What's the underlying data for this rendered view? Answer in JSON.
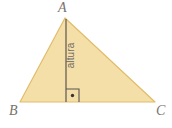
{
  "figure": {
    "type": "geometry-diagram",
    "background_color": "#ffffff",
    "triangle": {
      "fill_color": "#f5dfa8",
      "stroke_color": "#e0bd6a",
      "stroke_width": 1.2,
      "points": "65,18 20,102 155,102",
      "vertices": [
        {
          "name": "A",
          "label": "A",
          "x": 65,
          "y": 18
        },
        {
          "name": "B",
          "label": "B",
          "x": 20,
          "y": 102
        },
        {
          "name": "C",
          "label": "C",
          "x": 155,
          "y": 102
        }
      ]
    },
    "altitude": {
      "label": "altura",
      "stroke_color": "#5b5751",
      "stroke_width": 1.2,
      "x1": 66,
      "y1": 19,
      "x2": 66,
      "y2": 102
    },
    "right_angle": {
      "marker_color": "#5b5751",
      "dot_color": "#3a3732",
      "size": 13,
      "x": 66,
      "y": 89,
      "dot_x": 72.5,
      "dot_y": 95.5,
      "dot_radius": 1.7
    },
    "labels": {
      "apex": "A",
      "bottom_left": "B",
      "bottom_right": "C",
      "altitude": "altura",
      "label_color": "#77736e",
      "altitude_label_color": "#6f6b66"
    }
  }
}
